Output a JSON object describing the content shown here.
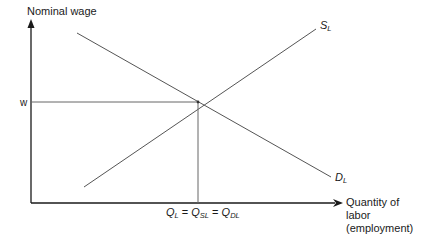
{
  "diagram": {
    "y_axis_label": "Nominal wage",
    "x_axis_label_lines": [
      "Quantity of",
      "labor",
      "(employment)"
    ],
    "wage_label": "w",
    "supply_curve": {
      "label": "S",
      "subscript": "L"
    },
    "demand_curve": {
      "label": "D",
      "subscript": "L"
    },
    "equilibrium_label": {
      "q1": "Q",
      "q1_sub": "L",
      "eq1": " = ",
      "q2": "Q",
      "q2_sub": "SL",
      "eq2": " = ",
      "q3": "Q",
      "q3_sub": "DL"
    },
    "colors": {
      "axes": "#1a1a1a",
      "curves": "#555555",
      "guides": "#666666"
    }
  }
}
